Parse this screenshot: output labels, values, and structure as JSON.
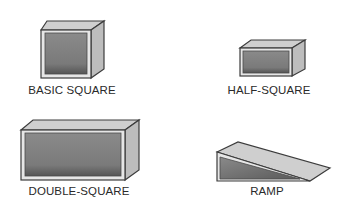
{
  "figure": {
    "items": [
      {
        "id": "basic-square",
        "label": "BASIC SQUARE"
      },
      {
        "id": "half-square",
        "label": "HALF-SQUARE"
      },
      {
        "id": "double-square",
        "label": "DOUBLE-SQUARE"
      },
      {
        "id": "ramp",
        "label": "RAMP"
      }
    ],
    "colors": {
      "outline": "#3c3c3c",
      "top_face": "#cfcfcf",
      "side_face": "#bdbdbd",
      "frame": "#e6e6e6",
      "interior": "#7f7f7f",
      "interior_dark": "#5e5e5e"
    }
  }
}
